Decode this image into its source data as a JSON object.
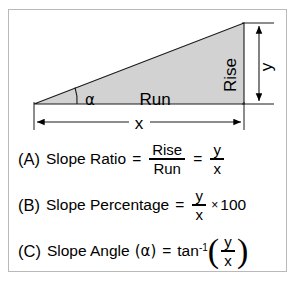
{
  "figure": {
    "frame_border_color": "#b9b9b9",
    "background": "#ffffff"
  },
  "diagram": {
    "name": "slope-triangle",
    "fill_color": "#d2d2d2",
    "stroke_color": "#000000",
    "labels": {
      "rise": "Rise",
      "run": "Run",
      "angle": "α",
      "vertical_dim": "y",
      "horizontal_dim": "x"
    }
  },
  "formulas": [
    {
      "tag": "(A)",
      "name": "slope-ratio",
      "text": "Slope Ratio",
      "equals": "=",
      "fraction1": {
        "numerator": "Rise",
        "denominator": "Run"
      },
      "equals2": "=",
      "fraction2": {
        "numerator": "y",
        "denominator": "x"
      }
    },
    {
      "tag": "(B)",
      "name": "slope-percentage",
      "text": "Slope Percentage",
      "equals": "=",
      "fraction1": {
        "numerator": "y",
        "denominator": "x"
      },
      "times": "×",
      "multiplier": "100"
    },
    {
      "tag": "(C)",
      "name": "slope-angle",
      "text": "Slope  Angle",
      "angle_paren": "(α)",
      "equals": "=",
      "function": "tan",
      "exponent": "-1",
      "paren_open": "(",
      "fraction1": {
        "numerator": "y",
        "denominator": "x"
      },
      "paren_close": ")"
    }
  ]
}
